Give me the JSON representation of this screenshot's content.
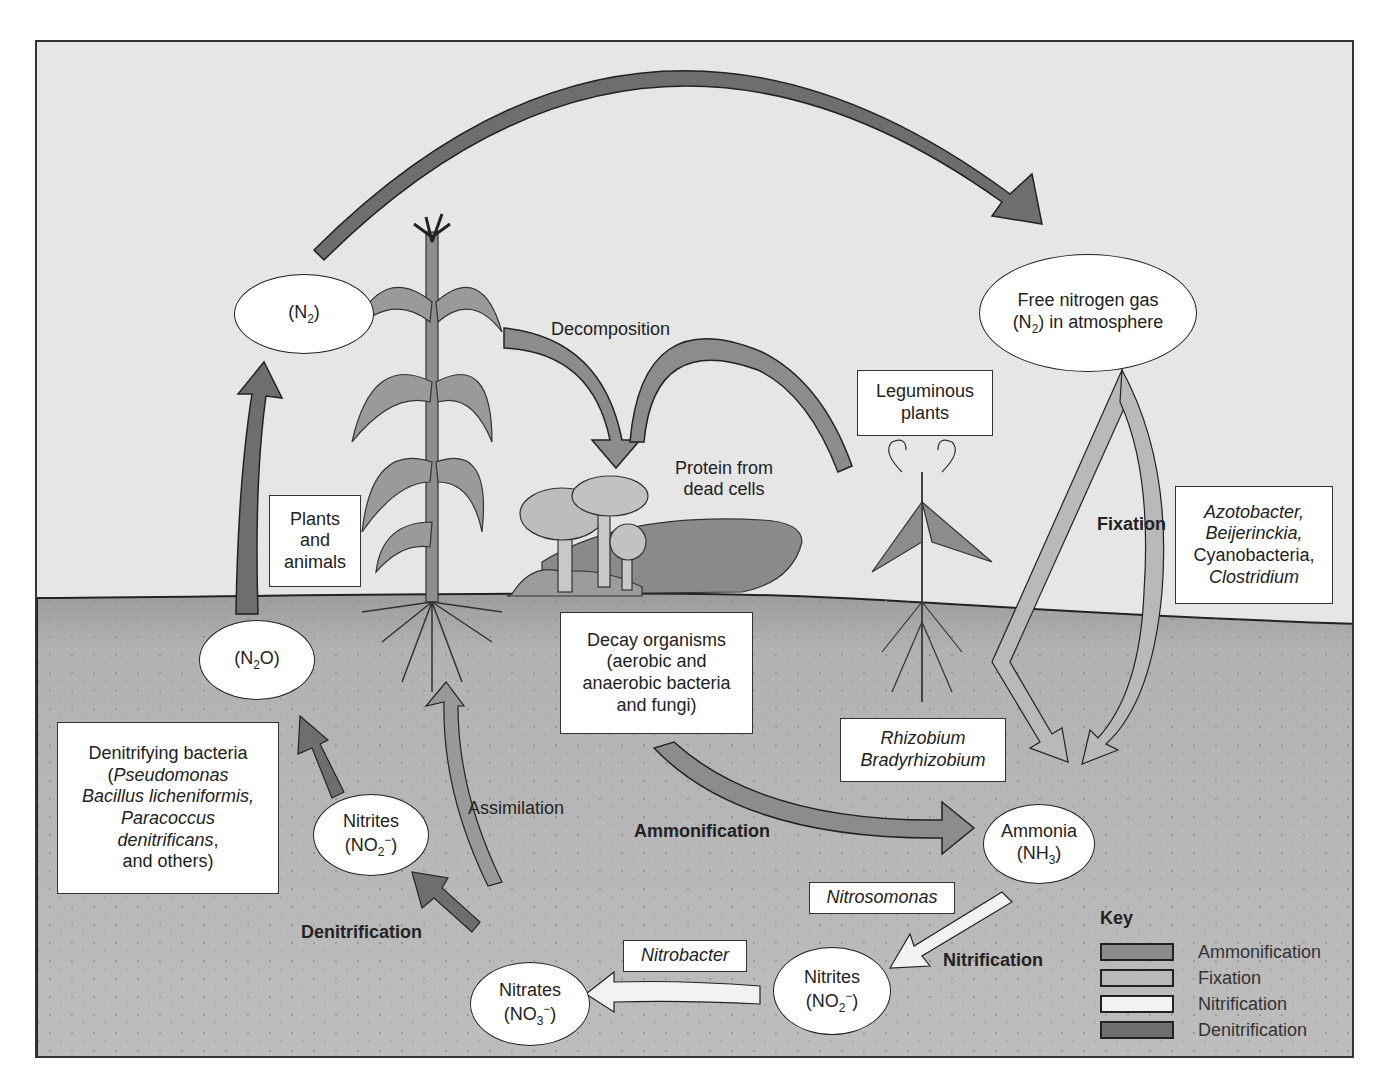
{
  "diagram": {
    "type": "nitrogen-cycle",
    "colors": {
      "sky": "#e6e6e6",
      "soil": "#b4b4b4",
      "ammonification": "#8c8c8c",
      "fixation": "#b9b9b9",
      "nitrification": "#f2f2f2",
      "denitrification": "#6e6e6e",
      "outline": "#222222"
    },
    "nodes": {
      "n2_top": {
        "label": "(N",
        "sub": "2",
        "tail": ")"
      },
      "free_nitrogen": {
        "line1": "Free nitrogen gas",
        "line2_pre": "(N",
        "line2_sub": "2",
        "line2_post": ") in atmosphere"
      },
      "n2o": {
        "label": "(N",
        "sub": "2",
        "tail": "O)"
      },
      "nitrites_left": {
        "line1": "Nitrites",
        "pre": "(NO",
        "sub": "2",
        "sup": "−",
        "post": ")"
      },
      "nitrates": {
        "line1": "Nitrates",
        "pre": "(NO",
        "sub": "3",
        "sup": "−",
        "post": ")"
      },
      "nitrites_right": {
        "line1": "Nitrites",
        "pre": "(NO",
        "sub": "2",
        "sup": "−",
        "post": ")"
      },
      "ammonia": {
        "line1": "Ammonia",
        "pre": "(NH",
        "sub": "3",
        "post": ")"
      }
    },
    "boxes": {
      "plants_animals": [
        "Plants",
        "and",
        "animals"
      ],
      "leguminous": [
        "Leguminous",
        "plants"
      ],
      "fixers": [
        "Azotobacter,",
        "Beijerinckia,",
        "Cyanobacteria,",
        "Clostridium"
      ],
      "decay": [
        "Decay organisms",
        "(aerobic and",
        "anaerobic bacteria",
        "and fungi)"
      ],
      "rhizobium": [
        "Rhizobium",
        "Bradyrhizobium"
      ],
      "denitrifying": {
        "title": "Denitrifying bacteria",
        "open": "(",
        "lines": [
          "Pseudomonas",
          "Bacillus licheniformis,",
          "Paracoccus",
          "denitrificans"
        ],
        "trail": ",",
        "close": "and others)"
      },
      "nitrosomonas": "Nitrosomonas",
      "nitrobacter": "Nitrobacter"
    },
    "labels": {
      "decomposition": "Decomposition",
      "protein": [
        "Protein from",
        "dead cells"
      ],
      "fixation": "Fixation",
      "assimilation": "Assimilation",
      "ammonification": "Ammonification",
      "denitrification": "Denitrification",
      "nitrification": "Nitrification"
    },
    "key": {
      "title": "Key",
      "items": [
        {
          "label": "Ammonification",
          "color": "#8c8c8c"
        },
        {
          "label": "Fixation",
          "color": "#b9b9b9"
        },
        {
          "label": "Nitrification",
          "color": "#f2f2f2"
        },
        {
          "label": "Denitrification",
          "color": "#6e6e6e"
        }
      ]
    }
  }
}
